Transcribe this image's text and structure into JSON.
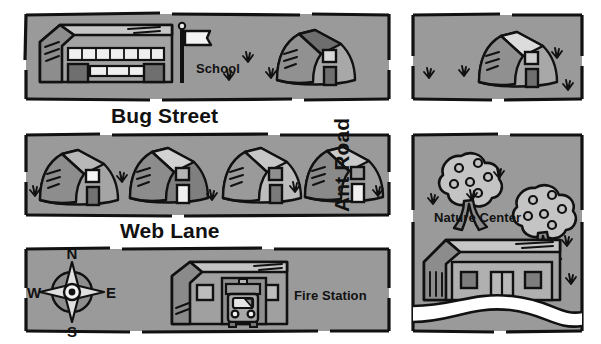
{
  "map": {
    "title": "Neighborhood Map",
    "background_color": "#ffffff",
    "block_fill": "#9a9a9a",
    "outline_color": "#111111",
    "river_color": "#ffffff",
    "streets": [
      {
        "name": "bug-street",
        "label": "Bug Street",
        "orientation": "horizontal"
      },
      {
        "name": "web-lane",
        "label": "Web Lane",
        "orientation": "horizontal"
      },
      {
        "name": "ant-road",
        "label": "Ant Road",
        "orientation": "vertical"
      }
    ],
    "places": [
      {
        "name": "school",
        "label": "School",
        "block": "top-left"
      },
      {
        "name": "fire-station",
        "label": "Fire Station",
        "block": "bottom-left"
      },
      {
        "name": "nature-center",
        "label": "Nature Center",
        "block": "bottom-right"
      }
    ],
    "compass": {
      "north": "N",
      "east": "E",
      "south": "S",
      "west": "W"
    },
    "blocks": [
      {
        "name": "block-top-left",
        "x": 25,
        "y": 13,
        "w": 365,
        "h": 87,
        "contents": [
          "school-building",
          "flagpole",
          "house",
          "grass"
        ]
      },
      {
        "name": "block-top-right",
        "x": 412,
        "y": 14,
        "w": 171,
        "h": 86,
        "contents": [
          "house",
          "grass"
        ]
      },
      {
        "name": "block-middle-left",
        "x": 25,
        "y": 134,
        "w": 365,
        "h": 82,
        "contents": [
          "house",
          "house",
          "house",
          "house",
          "grass"
        ]
      },
      {
        "name": "block-bottom-left",
        "x": 25,
        "y": 248,
        "w": 365,
        "h": 84,
        "contents": [
          "compass-rose",
          "fire-station-building",
          "fire-truck"
        ]
      },
      {
        "name": "block-bottom-right",
        "x": 412,
        "y": 134,
        "w": 171,
        "h": 198,
        "contents": [
          "tree",
          "tree",
          "nature-center-building",
          "river",
          "grass"
        ]
      }
    ],
    "house_count_web_lane": 4,
    "tree_count": 2
  }
}
